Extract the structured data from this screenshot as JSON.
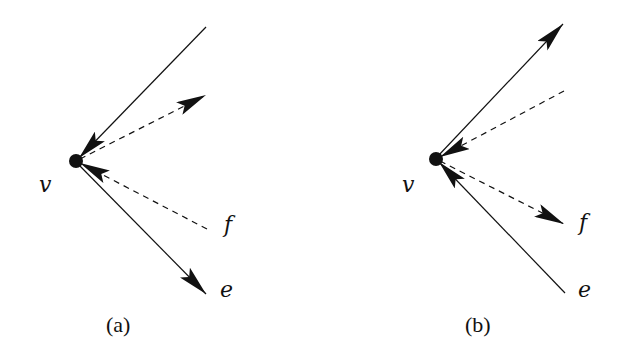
{
  "figure": {
    "panels": [
      {
        "id": "a",
        "caption": "(a)",
        "vertex": {
          "label": "v",
          "x": 76,
          "y": 161
        },
        "edges": [
          {
            "name": "upper-solid",
            "style": "solid",
            "from": [
              206,
              27
            ],
            "to": [
              76,
              161
            ],
            "arrow_at": "vertex"
          },
          {
            "name": "upper-dashed",
            "style": "dashed",
            "from": [
              76,
              161
            ],
            "to": [
              206,
              95
            ],
            "arrow_at": "end"
          },
          {
            "name": "f",
            "label": "f",
            "style": "dashed",
            "from": [
              207,
              229
            ],
            "to": [
              76,
              161
            ],
            "arrow_at": "vertex"
          },
          {
            "name": "e",
            "label": "e",
            "style": "solid",
            "from": [
              76,
              161
            ],
            "to": [
              206,
              294
            ],
            "arrow_at": "end"
          }
        ],
        "labels": {
          "v": "v",
          "f": "f",
          "e": "e"
        }
      },
      {
        "id": "b",
        "caption": "(b)",
        "vertex": {
          "label": "v",
          "x": 436,
          "y": 159
        },
        "edges": [
          {
            "name": "upper-solid",
            "style": "solid",
            "from": [
              436,
              159
            ],
            "to": [
              563,
              24
            ],
            "arrow_at": "end"
          },
          {
            "name": "upper-dashed",
            "style": "dashed",
            "from": [
              564,
              91
            ],
            "to": [
              436,
              159
            ],
            "arrow_at": "vertex"
          },
          {
            "name": "f",
            "label": "f",
            "style": "dashed",
            "from": [
              436,
              159
            ],
            "to": [
              564,
              224
            ],
            "arrow_at": "end"
          },
          {
            "name": "e",
            "label": "e",
            "style": "solid",
            "from": [
              565,
              293
            ],
            "to": [
              436,
              159
            ],
            "arrow_at": "vertex"
          }
        ],
        "labels": {
          "v": "v",
          "f": "f",
          "e": "e"
        }
      }
    ],
    "colors": {
      "stroke": "#111111",
      "background": "#ffffff"
    }
  }
}
